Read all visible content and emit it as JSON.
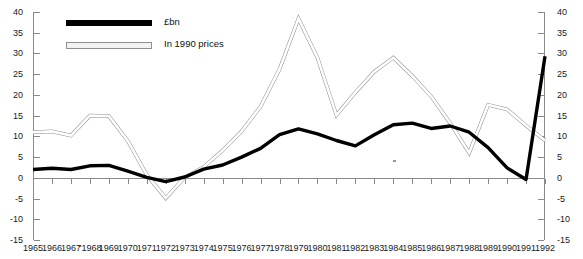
{
  "chart_data": {
    "type": "line",
    "title": "",
    "xlabel": "",
    "ylabel": "",
    "ylim": [
      -15,
      40
    ],
    "ytick_step": 5,
    "yticks": [
      40,
      35,
      30,
      25,
      20,
      15,
      10,
      5,
      0,
      -5,
      -10,
      -15
    ],
    "ytick_labels_left": [
      "40",
      "35",
      "30",
      "25",
      "20",
      "15",
      "10",
      "5",
      "0",
      "-5",
      "-10",
      "-15"
    ],
    "ytick_labels_right": [
      "40",
      "35",
      "30",
      "25",
      "20",
      "15",
      "10",
      "5",
      "0",
      "-5",
      "-10",
      "-15"
    ],
    "grid": false,
    "legend_position": "upper-left",
    "dual_axis": true,
    "categories": [
      "1965",
      "1966",
      "1967",
      "1968",
      "1969",
      "1970",
      "1971",
      "1972",
      "1973",
      "1974",
      "1975",
      "1976",
      "1977",
      "1978",
      "1979",
      "1980",
      "1981",
      "1982",
      "1983",
      "1984",
      "1985",
      "1986",
      "1987",
      "1988",
      "1989",
      "1990",
      "1991",
      "1992"
    ],
    "xtick_labels": [
      "1965",
      "1966",
      "1967",
      "\"1968",
      "1969",
      "1970",
      "1971",
      "1972",
      "1973",
      "1974",
      "1975",
      "1976",
      "1977",
      "1978",
      "1979",
      "1980",
      "1981",
      "1982",
      "1983",
      "1984",
      "1985",
      "1986",
      "1987",
      "1988",
      "1989",
      "1990",
      "1991",
      "1992"
    ],
    "series": [
      {
        "name": "£bn",
        "style": "solid-black",
        "values": [
          2.0,
          2.2,
          2.1,
          2.6,
          3.2,
          2.8,
          1.1,
          -0.6,
          0.0,
          1.0,
          3.0,
          5.0,
          7.8,
          11.0,
          11.6,
          10.2,
          9.8,
          8.0,
          10.5,
          12.2,
          13.0,
          12.6,
          11.8,
          10.5,
          6.2,
          5.7,
          9.9,
          12.0
        ]
      },
      {
        "name": "In 1990 prices",
        "style": "outline-white",
        "values": [
          11.0,
          11.2,
          10.2,
          14.9,
          15.1,
          9.0,
          3.6,
          -4.8,
          0.1,
          2.6,
          6.6,
          11.0,
          17.0,
          26.0,
          38.5,
          29.0,
          15.1,
          20.6,
          25.5,
          29.0,
          24.6,
          19.6,
          13.2,
          6.0,
          17.6,
          16.5,
          12.6,
          9.0
        ]
      }
    ],
    "series_points": {
      "cash": [
        [
          1965,
          2.0
        ],
        [
          1966,
          2.3
        ],
        [
          1967,
          2.0
        ],
        [
          1968,
          2.9
        ],
        [
          1969,
          3.0
        ],
        [
          1970,
          1.6
        ],
        [
          1971,
          0.1
        ],
        [
          1972,
          -0.9
        ],
        [
          1973,
          0.2
        ],
        [
          1974,
          2.1
        ],
        [
          1975,
          3.1
        ],
        [
          1976,
          5.0
        ],
        [
          1977,
          7.1
        ],
        [
          1978,
          10.4
        ],
        [
          1979,
          11.8
        ],
        [
          1980,
          10.6
        ],
        [
          1981,
          9.0
        ],
        [
          1982,
          7.7
        ],
        [
          1983,
          10.4
        ],
        [
          1984,
          12.8
        ],
        [
          1985,
          13.2
        ],
        [
          1986,
          11.9
        ],
        [
          1987,
          12.5
        ],
        [
          1988,
          11.0
        ],
        [
          1989,
          7.3
        ],
        [
          1990,
          2.4
        ],
        [
          1991,
          -0.4
        ],
        [
          1992,
          29.3
        ]
      ],
      "real": [
        [
          1965,
          11.0
        ],
        [
          1966,
          11.2
        ],
        [
          1967,
          10.2
        ],
        [
          1968,
          15.0
        ],
        [
          1969,
          14.9
        ],
        [
          1970,
          8.9
        ],
        [
          1971,
          0.7
        ],
        [
          1972,
          -4.9
        ],
        [
          1973,
          0.1
        ],
        [
          1974,
          2.6
        ],
        [
          1975,
          6.6
        ],
        [
          1976,
          11.2
        ],
        [
          1977,
          17.2
        ],
        [
          1978,
          26.2
        ],
        [
          1979,
          38.4
        ],
        [
          1980,
          29.0
        ],
        [
          1981,
          15.1
        ],
        [
          1982,
          20.6
        ],
        [
          1983,
          25.6
        ],
        [
          1984,
          29.0
        ],
        [
          1985,
          24.6
        ],
        [
          1986,
          19.6
        ],
        [
          1987,
          13.2
        ],
        [
          1988,
          6.0
        ],
        [
          1989,
          17.6
        ],
        [
          1990,
          16.5
        ],
        [
          1991,
          12.6
        ],
        [
          1992,
          9.0
        ]
      ]
    }
  },
  "legend": {
    "items": [
      {
        "label": "£bn",
        "swatch": "cash"
      },
      {
        "label": "In 1990 prices",
        "swatch": "real"
      }
    ]
  }
}
